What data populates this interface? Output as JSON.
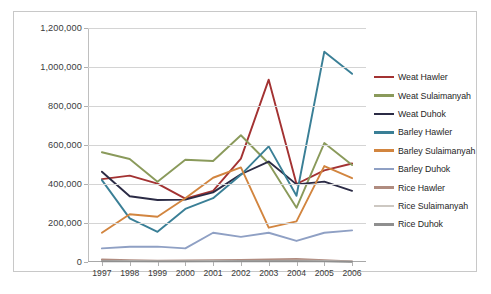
{
  "chart_data": {
    "type": "line",
    "title": "",
    "xlabel": "",
    "ylabel": "",
    "categories": [
      "1997",
      "1998",
      "1999",
      "2000",
      "2001",
      "2002",
      "2003",
      "2004",
      "2005",
      "2006"
    ],
    "x": [
      1997,
      1998,
      1999,
      2000,
      2001,
      2002,
      2003,
      2004,
      2005,
      2006
    ],
    "ylim": [
      0,
      1200000
    ],
    "ytick_labels": [
      "0",
      "200,000",
      "400,000",
      "600,000",
      "800,000",
      "1,000,000",
      "1,200,000"
    ],
    "ytick_values": [
      0,
      200000,
      400000,
      600000,
      800000,
      1000000,
      1200000
    ],
    "grid": true,
    "legend_position": "right",
    "series": [
      {
        "name": "Weat Hawler",
        "color": "#a33232",
        "values": [
          425000,
          443000,
          402000,
          325000,
          365000,
          530000,
          935000,
          400000,
          470000,
          505000
        ]
      },
      {
        "name": "Weat Sulaimanyah",
        "color": "#8a9a5b",
        "values": [
          563000,
          528000,
          412000,
          524000,
          518000,
          650000,
          505000,
          278000,
          610000,
          497000
        ]
      },
      {
        "name": "Weat Duhok",
        "color": "#2b2b45",
        "values": [
          463000,
          337000,
          318000,
          320000,
          357000,
          450000,
          515000,
          398000,
          412000,
          365000
        ]
      },
      {
        "name": "Barley Hawler",
        "color": "#3a7f96",
        "values": [
          420000,
          224000,
          155000,
          272000,
          327000,
          447000,
          593000,
          340000,
          1078000,
          965000
        ]
      },
      {
        "name": "Barley Sulaimanyah",
        "color": "#d2853f",
        "values": [
          150000,
          245000,
          232000,
          327000,
          432000,
          485000,
          176000,
          208000,
          492000,
          430000
        ]
      },
      {
        "name": "Barley Duhok",
        "color": "#8fa0c4",
        "values": [
          70000,
          78000,
          79000,
          70000,
          150000,
          129000,
          150000,
          108000,
          150000,
          162000
        ]
      },
      {
        "name": "Rice Hawler",
        "color": "#b08c80",
        "values": [
          13000,
          9000,
          7000,
          8000,
          9000,
          11000,
          13000,
          15000,
          9000,
          3000
        ]
      },
      {
        "name": "Rice Sulaimanyah",
        "color": "#cdc8c2",
        "values": [
          6000,
          5000,
          4000,
          4000,
          5000,
          6000,
          6000,
          7000,
          5000,
          2000
        ]
      },
      {
        "name": "Rice Duhok",
        "color": "#8f8f8f",
        "values": [
          4000,
          3000,
          3000,
          3000,
          3000,
          4000,
          4000,
          4000,
          3000,
          1000
        ]
      }
    ]
  },
  "caption": ""
}
